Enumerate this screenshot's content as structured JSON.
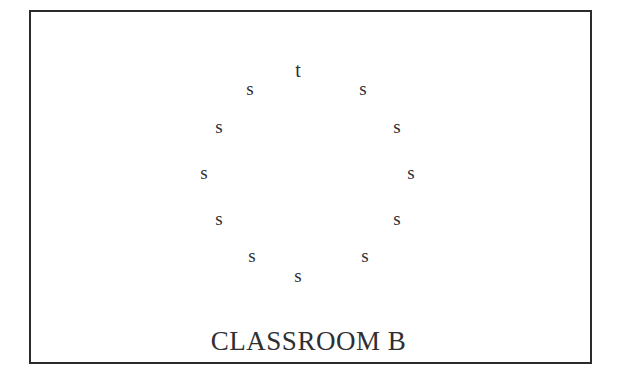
{
  "diagram": {
    "title": "CLASSROOM B",
    "colors": {
      "boundary": "#2b2b2b",
      "text": "#2f2f33",
      "background": "#ffffff"
    },
    "boundary": {
      "name": "classroom-boundary",
      "x": 29,
      "y": 10,
      "width": 563,
      "height": 354,
      "stroke_width": 2
    },
    "legend": {
      "teacher_symbol": "t",
      "student_symbol": "s"
    },
    "counts": {
      "teachers": 1,
      "students": 11,
      "total": 12
    },
    "seats": [
      {
        "label": "t",
        "role": "teacher",
        "x": 298,
        "y": 70,
        "clock": 12
      },
      {
        "label": "s",
        "role": "student",
        "x": 250,
        "y": 89,
        "clock": 11
      },
      {
        "label": "s",
        "role": "student",
        "x": 363,
        "y": 89,
        "clock": 1
      },
      {
        "label": "s",
        "role": "student",
        "x": 219,
        "y": 127,
        "clock": 10
      },
      {
        "label": "s",
        "role": "student",
        "x": 397,
        "y": 127,
        "clock": 2
      },
      {
        "label": "s",
        "role": "student",
        "x": 204,
        "y": 173,
        "clock": 9
      },
      {
        "label": "s",
        "role": "student",
        "x": 411,
        "y": 173,
        "clock": 3
      },
      {
        "label": "s",
        "role": "student",
        "x": 219,
        "y": 219,
        "clock": 8
      },
      {
        "label": "s",
        "role": "student",
        "x": 397,
        "y": 219,
        "clock": 4
      },
      {
        "label": "s",
        "role": "student",
        "x": 252,
        "y": 256,
        "clock": 7
      },
      {
        "label": "s",
        "role": "student",
        "x": 365,
        "y": 256,
        "clock": 5
      },
      {
        "label": "s",
        "role": "student",
        "x": 298,
        "y": 276,
        "clock": 6
      }
    ]
  }
}
